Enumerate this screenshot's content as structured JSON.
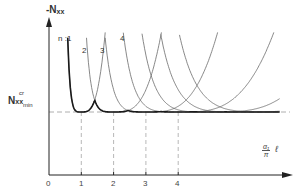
{
  "chart_data": {
    "type": "line",
    "title": "",
    "ylabel": "-N_xx",
    "xlabel": "(α₁/π) ℓ",
    "y_reference_label": "N_xx_min^cr",
    "x_ticks": [
      "0",
      "1",
      "2",
      "3",
      "4"
    ],
    "series": [
      {
        "name": "n = 1",
        "label": "n :1",
        "minimum_at": 1,
        "emphasis": "bold-lower-envelope"
      },
      {
        "name": "n = 2",
        "label": "2",
        "minimum_at": 2
      },
      {
        "name": "n = 3",
        "label": "3",
        "minimum_at": 3
      },
      {
        "name": "n = 4",
        "label": "4",
        "minimum_at": 4
      },
      {
        "name": "n = 5",
        "label": "",
        "minimum_at": 5
      },
      {
        "name": "n = 6",
        "label": "",
        "minimum_at": 6
      },
      {
        "name": "n = 7",
        "label": "",
        "minimum_at": 7
      }
    ],
    "envelope": "bold lower envelope touching N_min at integer x values 1,2,3,4,...",
    "dashed_lines": [
      "horizontal at N_xx_min^cr",
      "vertical at x=1,2,3,4"
    ]
  },
  "labels": {
    "y_axis": {
      "main": "-N",
      "sub": "xx"
    },
    "nmin": {
      "main": "N",
      "sup": "cr",
      "sub": "xx",
      "sub2": "min"
    },
    "x_axis": {
      "num": "α₁",
      "den": "π",
      "after": "ℓ"
    },
    "ticks": [
      "0",
      "1",
      "2",
      "3",
      "4"
    ],
    "curves": [
      "n :1",
      "2",
      "3",
      "4"
    ]
  },
  "colors": {
    "envelope": "#1a1a1a",
    "curve": "#6a6a6a",
    "axis": "#222222",
    "dashed": "#9a9a9a"
  }
}
